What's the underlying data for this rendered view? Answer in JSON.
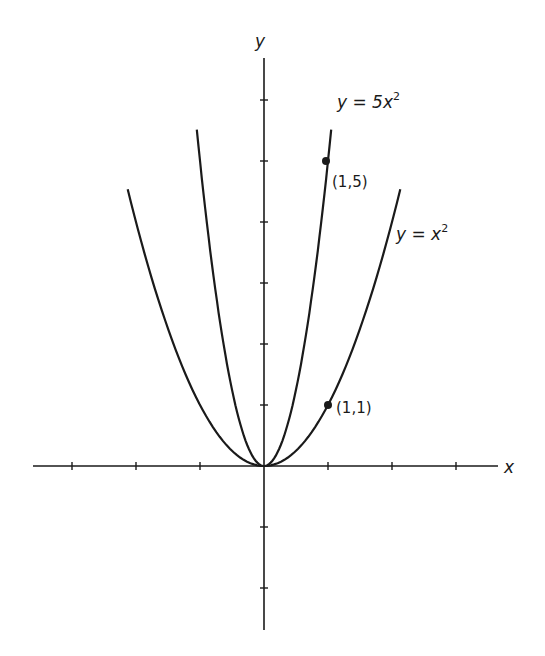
{
  "chart_data": {
    "type": "line",
    "title": "",
    "xlabel": "x",
    "ylabel": "y",
    "xlim": [
      -3.6,
      3.6
    ],
    "ylim": [
      -2.7,
      6.7
    ],
    "grid": false,
    "x_ticks": [
      -3,
      -2,
      -1,
      1,
      2,
      3
    ],
    "y_ticks": [
      -2,
      -1,
      1,
      2,
      3,
      4,
      5,
      6
    ],
    "tick_labels_shown": false,
    "series": [
      {
        "name": "y = x^2",
        "label": "y = x²",
        "function": "x^2",
        "x_range": [
          -2.13,
          2.13
        ],
        "x": [
          -2.13,
          -2,
          -1.5,
          -1,
          -0.5,
          0,
          0.5,
          1,
          1.5,
          2,
          2.13
        ],
        "values": [
          4.54,
          4,
          2.25,
          1,
          0.25,
          0,
          0.25,
          1,
          2.25,
          4,
          4.54
        ]
      },
      {
        "name": "y = 5x^2",
        "label": "y = 5x²",
        "function": "5*x^2",
        "x_range": [
          -1.05,
          1.05
        ],
        "x": [
          -1.05,
          -1,
          -0.75,
          -0.5,
          -0.25,
          0,
          0.25,
          0.5,
          0.75,
          1,
          1.05
        ],
        "values": [
          5.51,
          5,
          2.81,
          1.25,
          0.31,
          0,
          0.31,
          1.25,
          2.81,
          5,
          5.51
        ]
      }
    ],
    "annotations": [
      {
        "text": "(1,1)",
        "point": [
          1,
          1
        ],
        "marker": "filled-dot"
      },
      {
        "text": "(1,5)",
        "point": [
          1,
          5
        ],
        "marker": "filled-dot"
      }
    ]
  },
  "labels": {
    "x_axis": "x",
    "y_axis": "y",
    "curve_x2_prefix": "y = x",
    "curve_x2_exp": "2",
    "curve_5x2_prefix": "y = 5x",
    "curve_5x2_exp": "2",
    "point_1_1": "(1,1)",
    "point_1_5": "(1,5)"
  }
}
